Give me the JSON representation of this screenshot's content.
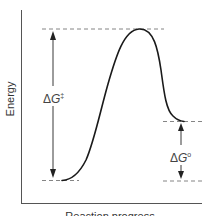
{
  "diagram": {
    "type": "reaction-energy-profile",
    "axes": {
      "y_label": "Energy",
      "x_label": "Reaction progress"
    },
    "levels": {
      "reactants": "reactant energy level",
      "transition_state": "transition state energy level",
      "products": "product energy level"
    },
    "annotations": {
      "activation": {
        "delta": "Δ",
        "symbol": "G",
        "superscript": "‡"
      },
      "standard": {
        "delta": "Δ",
        "symbol": "G",
        "superscript": "o"
      }
    },
    "colors": {
      "curve": "#1a1a1a",
      "axis": "#555555",
      "dashed": "#777777",
      "arrow": "#222222",
      "text": "#333333"
    }
  }
}
